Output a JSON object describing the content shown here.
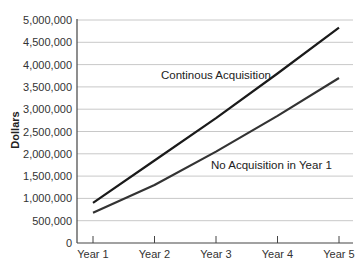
{
  "chart_data": {
    "type": "line",
    "title": "",
    "xlabel": "",
    "ylabel": "Dollars",
    "categories": [
      "Year 1",
      "Year 2",
      "Year 3",
      "Year 4",
      "Year 5"
    ],
    "series": [
      {
        "name": "Continous Acquisition",
        "values": [
          900000,
          1850000,
          2800000,
          3800000,
          4830000
        ],
        "color": "#1a1a1a"
      },
      {
        "name": "No Acquisition in Year 1",
        "values": [
          680000,
          1300000,
          2050000,
          2850000,
          3700000
        ],
        "color": "#333333"
      }
    ],
    "yticks": [
      0,
      500000,
      1000000,
      1500000,
      2000000,
      2500000,
      3000000,
      3500000,
      4000000,
      4500000,
      5000000
    ],
    "ytick_labels": [
      "0",
      "500,000",
      "1,000,000",
      "1,500,000",
      "2,000,000",
      "2,500,000",
      "3,000,000",
      "3,500,000",
      "4,000,000",
      "4,500,000",
      "5,000,000"
    ],
    "ylim": [
      0,
      5000000
    ],
    "grid": true,
    "legend": "inline annotations",
    "annotations": [
      {
        "text": "Continous Acquisition",
        "series": 0
      },
      {
        "text": "No Acquisition in Year 1",
        "series": 1
      }
    ]
  }
}
